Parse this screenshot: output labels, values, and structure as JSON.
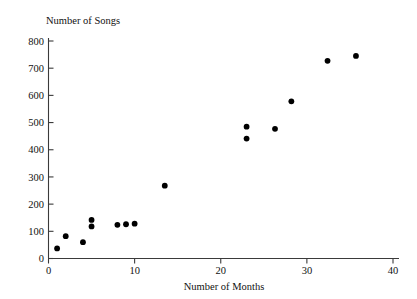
{
  "chart_data": {
    "type": "scatter",
    "title": "",
    "xlabel": "Number of Months",
    "ylabel": "Number of Songs",
    "xlim": [
      0,
      41
    ],
    "ylim": [
      0,
      820
    ],
    "xticks": [
      0,
      10,
      20,
      30,
      40
    ],
    "yticks": [
      0,
      100,
      200,
      300,
      400,
      500,
      600,
      700,
      800
    ],
    "xtick_labels": [
      "0",
      "10",
      "20",
      "30",
      "40"
    ],
    "ytick_labels": [
      "0",
      "100",
      "200",
      "300",
      "400",
      "500",
      "600",
      "700",
      "800"
    ],
    "grid": false,
    "legend": false,
    "marker": "filled-circle",
    "marker_color": "#000000",
    "axis_color": "#3a3a3a",
    "background_color": "#ffffff",
    "x": [
      1,
      2,
      4,
      5,
      5,
      8,
      9,
      10,
      13.5,
      23,
      23,
      26.3,
      28.2,
      32.4,
      35.7
    ],
    "y": [
      37,
      82,
      60,
      142,
      118,
      124,
      126,
      128,
      268,
      485,
      441,
      477,
      578,
      727,
      745
    ],
    "points": [
      {
        "x": 1,
        "y": 37
      },
      {
        "x": 2,
        "y": 82
      },
      {
        "x": 4,
        "y": 60
      },
      {
        "x": 5,
        "y": 142
      },
      {
        "x": 5,
        "y": 118
      },
      {
        "x": 8,
        "y": 124
      },
      {
        "x": 9,
        "y": 126
      },
      {
        "x": 10,
        "y": 128
      },
      {
        "x": 13.5,
        "y": 268
      },
      {
        "x": 23,
        "y": 485
      },
      {
        "x": 23,
        "y": 441
      },
      {
        "x": 26.3,
        "y": 477
      },
      {
        "x": 28.2,
        "y": 578
      },
      {
        "x": 32.4,
        "y": 727
      },
      {
        "x": 35.7,
        "y": 745
      }
    ]
  }
}
